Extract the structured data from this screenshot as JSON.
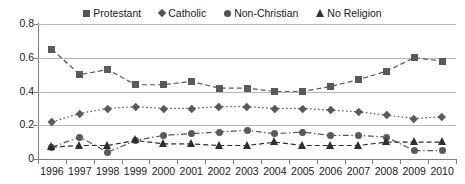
{
  "chart_data": {
    "type": "line",
    "title": "",
    "xlabel": "",
    "ylabel": "",
    "ylim": [
      0,
      0.8
    ],
    "yticks": [
      "0",
      "0.2",
      "0.4",
      "0.6",
      "0.8"
    ],
    "ytick_values": [
      0,
      0.2,
      0.4,
      0.6,
      0.8
    ],
    "grid": true,
    "legend_position": "top-center",
    "categories": [
      "1996",
      "1997",
      "1998",
      "1999",
      "2000",
      "2001",
      "2002",
      "2003",
      "2004",
      "2005",
      "2006",
      "2007",
      "2008",
      "2009",
      "2010"
    ],
    "series": [
      {
        "name": "Protestant",
        "marker": "square",
        "linestyle": "dashed",
        "color": "#5a5a5a",
        "values": [
          0.65,
          0.5,
          0.53,
          0.44,
          0.44,
          0.46,
          0.42,
          0.42,
          0.4,
          0.4,
          0.43,
          0.47,
          0.52,
          0.6,
          0.58
        ]
      },
      {
        "name": "Catholic",
        "marker": "diamond",
        "linestyle": "dotted",
        "color": "#5a5a5a",
        "values": [
          0.22,
          0.27,
          0.3,
          0.31,
          0.3,
          0.3,
          0.31,
          0.31,
          0.3,
          0.3,
          0.29,
          0.28,
          0.26,
          0.24,
          0.25
        ]
      },
      {
        "name": "Non-Christian",
        "marker": "circle",
        "linestyle": "dash-dot",
        "color": "#5a5a5a",
        "values": [
          0.07,
          0.13,
          0.04,
          0.11,
          0.14,
          0.15,
          0.16,
          0.17,
          0.15,
          0.16,
          0.14,
          0.14,
          0.13,
          0.05,
          0.05
        ]
      },
      {
        "name": "No Religion",
        "marker": "triangle",
        "linestyle": "dashed",
        "color": "#2e2e2e",
        "values": [
          0.07,
          0.08,
          0.08,
          0.11,
          0.09,
          0.09,
          0.08,
          0.08,
          0.1,
          0.08,
          0.08,
          0.08,
          0.1,
          0.1,
          0.1
        ]
      }
    ]
  }
}
